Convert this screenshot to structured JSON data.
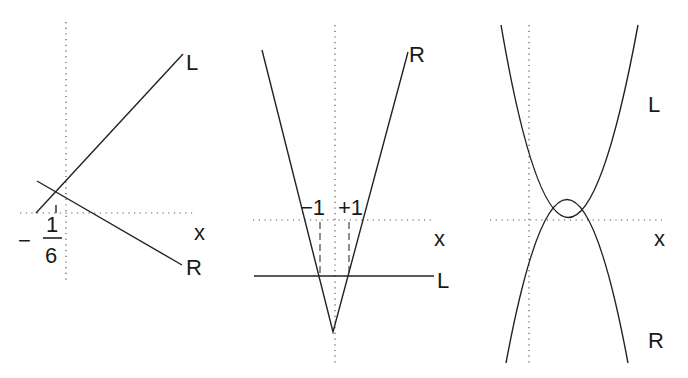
{
  "panels": [
    {
      "id": "left",
      "description": "Two lines L (increasing) and R (decreasing) intersecting left of the vertical axis at x = -1/6",
      "labels": {
        "L": "L",
        "R": "R",
        "x_axis": "x",
        "minus": "−",
        "frac_num": "1",
        "frac_den": "6"
      }
    },
    {
      "id": "middle",
      "description": "V-shaped curve R with vertex below the x-axis; horizontal line L below the x-axis intersecting R at x = -1 and x = +1",
      "labels": {
        "R": "R",
        "L": "L",
        "x_axis": "x",
        "neg_one": "−1",
        "pos_one": "+1"
      }
    },
    {
      "id": "right",
      "description": "Upward curve L and downward curve R forming a lens shape, intersecting on the x-axis at two points",
      "labels": {
        "L": "L",
        "R": "R",
        "x_axis": "x"
      }
    }
  ]
}
